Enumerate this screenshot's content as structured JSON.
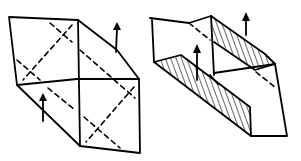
{
  "diagram": {
    "type": "origami-folding-steps",
    "background": "#ffffff",
    "ink_color": "#000000",
    "figures": [
      {
        "id": "step-1",
        "description": "Flattened box-like form with dashed X crease lines on two square panels",
        "arrows": [
          {
            "direction": "up",
            "position": "right-upper-edge"
          },
          {
            "direction": "up",
            "position": "left-lower-edge"
          }
        ],
        "crease_style": "dashed"
      },
      {
        "id": "step-2",
        "description": "Sides raised into walls; hatched regions show inner wall surfaces",
        "arrows": [
          {
            "direction": "up",
            "position": "upper-right-wall"
          },
          {
            "direction": "up",
            "position": "lower-left-wall"
          }
        ],
        "shading": "diagonal hatching"
      }
    ]
  }
}
